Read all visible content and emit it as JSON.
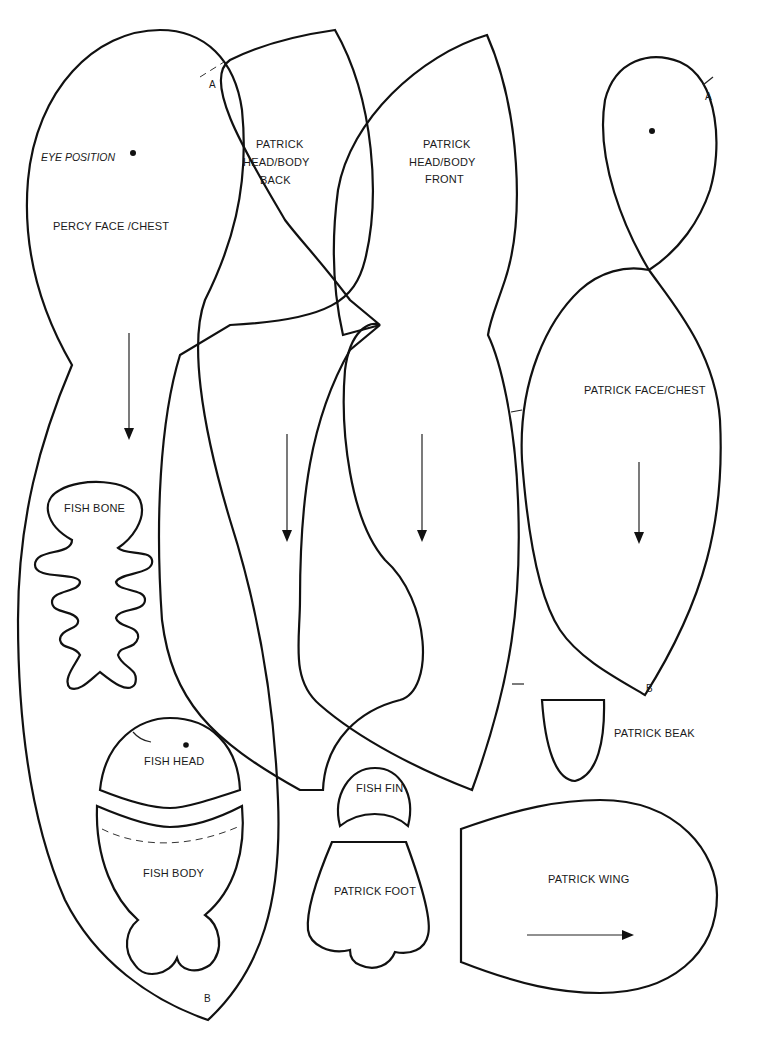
{
  "pieces": {
    "percy_face_chest": {
      "label": "PERCY FACE /CHEST",
      "eye_label": "EYE POSITION",
      "marker_top": "A",
      "marker_bottom": "B"
    },
    "patrick_head_body_back": {
      "label_lines": [
        "PATRICK",
        "HEAD/BODY",
        "BACK"
      ]
    },
    "patrick_head_body_front": {
      "label_lines": [
        "PATRICK",
        "HEAD/BODY",
        "FRONT"
      ]
    },
    "patrick_face_chest": {
      "label": "PATRICK FACE/CHEST",
      "marker_top": "A",
      "marker_bottom": "B"
    },
    "fish_bone": {
      "label": "FISH BONE"
    },
    "fish_head": {
      "label": "FISH HEAD"
    },
    "fish_body": {
      "label": "FISH BODY"
    },
    "fish_fin": {
      "label": "FISH FIN"
    },
    "patrick_foot": {
      "label": "PATRICK FOOT"
    },
    "patrick_beak": {
      "label": "PATRICK BEAK"
    },
    "patrick_wing": {
      "label": "PATRICK WING"
    }
  },
  "grain_arrows": [
    "down",
    "down",
    "down",
    "down",
    "down",
    "right"
  ],
  "colors": {
    "line": "#111111",
    "background": "#ffffff"
  }
}
